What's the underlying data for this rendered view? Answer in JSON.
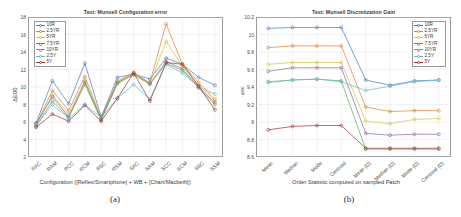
{
  "figure": {
    "caption_a": "(a)",
    "caption_b": "(b)"
  },
  "series_colors": [
    "#4878b4",
    "#d9822b",
    "#d9c22b",
    "#8e63a8",
    "#62a84a",
    "#5bbcd4",
    "#a62b2b"
  ],
  "legend_labels": [
    "10R",
    "2.5YR",
    "5YR",
    "7.5YR",
    "10YR",
    "2.5Y",
    "5Y"
  ],
  "chart_data": [
    {
      "id": "panel-a",
      "type": "line",
      "title": "Test: Munsell Configuration error",
      "xlabel": "Configuration ([Reflex/Smartphone] + WB + [Chart/Macbeth])",
      "ylabel": "ΔE00",
      "ylim": [
        2,
        18
      ],
      "yticks": [
        2,
        4,
        6,
        8,
        10,
        12,
        14,
        16,
        18
      ],
      "grid": true,
      "legend_position": "top-left",
      "categories": [
        "RAC",
        "RAM",
        "RCC",
        "RCM",
        "RSC",
        "RSM",
        "SAC",
        "SAM",
        "SCC",
        "SCM",
        "SSC",
        "SSM"
      ],
      "series": [
        {
          "name": "10R",
          "values": [
            5.9,
            10.7,
            8.1,
            12.7,
            6.6,
            11.1,
            11.5,
            10.9,
            13.3,
            12.6,
            11.1,
            10.2
          ]
        },
        {
          "name": "2.5YR",
          "values": [
            5.7,
            9.6,
            7.3,
            11.2,
            6.4,
            10.7,
            11.6,
            10.5,
            17.2,
            12.6,
            10.5,
            8.6
          ]
        },
        {
          "name": "5YR",
          "values": [
            5.6,
            9.1,
            6.9,
            10.7,
            6.3,
            10.5,
            11.7,
            10.4,
            15.2,
            12.4,
            10.2,
            8.4
          ]
        },
        {
          "name": "7.5YR",
          "values": [
            5.8,
            8.9,
            6.6,
            10.6,
            6.4,
            10.5,
            11.5,
            10.4,
            12.9,
            12.1,
            10.0,
            8.2
          ]
        },
        {
          "name": "10YR",
          "values": [
            5.5,
            8.4,
            6.5,
            10.3,
            6.2,
            10.4,
            11.4,
            10.3,
            12.7,
            11.9,
            9.9,
            8.0
          ]
        },
        {
          "name": "2.5Y",
          "values": [
            5.6,
            8.0,
            6.4,
            8.0,
            6.5,
            8.7,
            10.3,
            8.6,
            12.6,
            11.6,
            10.0,
            9.2
          ]
        },
        {
          "name": "5Y",
          "values": [
            5.4,
            6.9,
            6.1,
            7.9,
            6.1,
            8.7,
            11.6,
            8.4,
            12.8,
            12.6,
            10.1,
            7.4
          ]
        }
      ]
    },
    {
      "id": "panel-b",
      "type": "line",
      "title": "Test: Munsell Discretization Gain",
      "xlabel": "Order Statistic computed on sampled Patch",
      "ylabel": "ΔE00",
      "ylim": [
        8.6,
        10.2
      ],
      "yticks": [
        8.6,
        8.8,
        9,
        9.2,
        9.4,
        9.6,
        9.8,
        10,
        10.2
      ],
      "grid": true,
      "legend_position": "top-right",
      "categories": [
        "Mean",
        "Median",
        "Mode",
        "Centroid",
        "Mean (D)",
        "Median (D)",
        "Mode (D)",
        "Centroid (D)"
      ],
      "series": [
        {
          "name": "10R",
          "values": [
            10.07,
            10.08,
            10.08,
            10.08,
            9.48,
            9.42,
            9.47,
            9.48
          ]
        },
        {
          "name": "2.5YR",
          "values": [
            9.85,
            9.87,
            9.87,
            9.87,
            9.17,
            9.12,
            9.13,
            9.13
          ]
        },
        {
          "name": "5YR",
          "values": [
            9.66,
            9.68,
            9.68,
            9.68,
            9.01,
            8.98,
            9.03,
            9.04
          ]
        },
        {
          "name": "7.5YR",
          "values": [
            9.58,
            9.62,
            9.62,
            9.62,
            8.87,
            8.85,
            8.86,
            8.86
          ]
        },
        {
          "name": "10YR",
          "values": [
            9.46,
            9.48,
            9.49,
            9.47,
            8.69,
            8.69,
            8.69,
            8.69
          ]
        },
        {
          "name": "2.5Y",
          "values": [
            9.45,
            9.48,
            9.49,
            9.46,
            9.36,
            9.41,
            9.46,
            9.48
          ]
        },
        {
          "name": "5Y",
          "values": [
            8.91,
            8.95,
            8.96,
            8.96,
            8.7,
            8.7,
            8.7,
            8.7
          ]
        }
      ]
    }
  ]
}
